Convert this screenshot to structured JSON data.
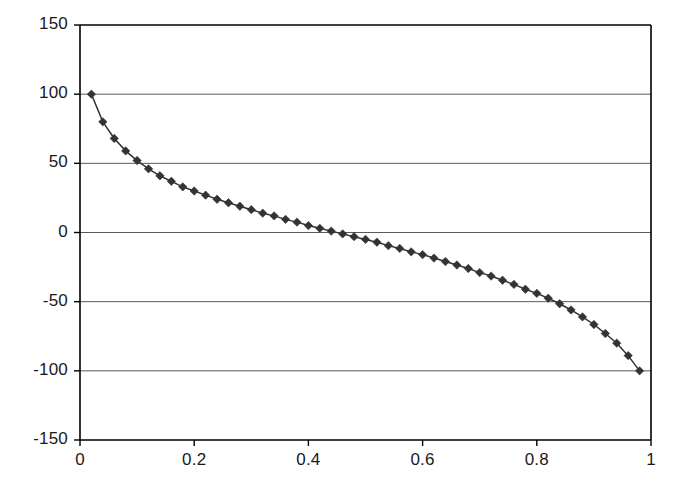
{
  "chart_data": {
    "type": "scatter",
    "title": "",
    "subtitle": "",
    "xlabel": "",
    "ylabel": "",
    "xlim": [
      0,
      1
    ],
    "ylim": [
      -150,
      150
    ],
    "xticks": [
      "0",
      "0.2",
      "0.4",
      "0.6",
      "0.8",
      "1"
    ],
    "xtick_values": [
      0,
      0.2,
      0.4,
      0.6,
      0.8,
      1
    ],
    "yticks": [
      "150",
      "100",
      "50",
      "0",
      "-50",
      "-100",
      "-150"
    ],
    "ytick_values": [
      150,
      100,
      50,
      0,
      -50,
      -100,
      -150
    ],
    "grid": "horizontal",
    "legend": "none",
    "marker": "diamond",
    "marker_color": "#333333",
    "line_color": "#333333",
    "axis_color": "#000000",
    "grid_color": "#595959",
    "series": [
      {
        "name": "series-1",
        "x": [
          0.02,
          0.04,
          0.06,
          0.08,
          0.1,
          0.12,
          0.14,
          0.16,
          0.18,
          0.2,
          0.22,
          0.24,
          0.26,
          0.28,
          0.3,
          0.32,
          0.34,
          0.36,
          0.38,
          0.4,
          0.42,
          0.44,
          0.46,
          0.48,
          0.5,
          0.52,
          0.54,
          0.56,
          0.58,
          0.6,
          0.62,
          0.64,
          0.66,
          0.68,
          0.7,
          0.72,
          0.74,
          0.76,
          0.78,
          0.8,
          0.82,
          0.84,
          0.86,
          0.88,
          0.9,
          0.92,
          0.94,
          0.96,
          0.98
        ],
        "y": [
          100,
          80,
          68,
          59,
          52,
          46,
          41,
          37,
          33,
          30,
          27,
          24,
          21.5,
          19,
          16.5,
          14,
          12,
          9.5,
          7.5,
          5,
          3,
          1,
          -1,
          -3,
          -5,
          -7,
          -9.5,
          -11.5,
          -14,
          -16,
          -18.5,
          -21,
          -23.5,
          -26,
          -29,
          -31.5,
          -34.5,
          -37.5,
          -41,
          -44,
          -47.5,
          -51.5,
          -56,
          -61,
          -66.5,
          -73,
          -80,
          -89,
          -100
        ]
      }
    ]
  },
  "axes": {
    "plot_left_px": 80,
    "plot_right_px": 651,
    "plot_top_px": 25,
    "plot_bottom_px": 440
  }
}
